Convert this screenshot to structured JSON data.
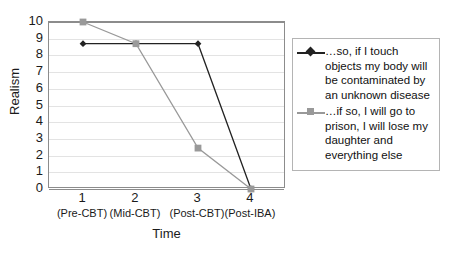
{
  "chart_data": {
    "type": "line",
    "title": "",
    "xlabel": "Time",
    "ylabel": "Realism",
    "ylim": [
      0,
      10
    ],
    "ytick_labels": [
      "10",
      "9",
      "8",
      "7",
      "6",
      "5",
      "4",
      "3",
      "2",
      "1",
      "0"
    ],
    "grid": true,
    "legend_position": "right",
    "x": [
      1,
      2,
      3,
      4
    ],
    "categories": [
      "1",
      "2",
      "3",
      "4"
    ],
    "category_sublabels": [
      "(Pre-CBT)",
      "(Mid-CBT)",
      "(Post-CBT)",
      "(Post-IBA)"
    ],
    "series": [
      {
        "name": "…so, if I touch objects my body will be contaminated by an unknown disease",
        "marker": "diamond",
        "color": "#222222",
        "values": [
          8.7,
          8.7,
          8.7,
          0
        ]
      },
      {
        "name": "…if so, I will go to prison, I will lose my daughter and everything else",
        "marker": "square",
        "color": "#999999",
        "values": [
          10,
          8.7,
          2.45,
          0
        ]
      }
    ]
  },
  "axes": {
    "y_title": "Realism",
    "x_title": "Time",
    "y_ticks": [
      "10",
      "9",
      "8",
      "7",
      "6",
      "5",
      "4",
      "3",
      "2",
      "1",
      "0"
    ],
    "x_ticks": [
      {
        "num": "1",
        "sub": "(Pre-CBT)"
      },
      {
        "num": "2",
        "sub": "(Mid-CBT)"
      },
      {
        "num": "3",
        "sub": "(Post-CBT)"
      },
      {
        "num": "4",
        "sub": "(Post-IBA)"
      }
    ]
  },
  "legend": {
    "entries": [
      {
        "marker": "diamond",
        "color": "#222222",
        "label": "…so, if I touch objects my body will be contaminated by an unknown disease"
      },
      {
        "marker": "square",
        "color": "#999999",
        "label": "…if so, I will go to prison, I will lose my daughter and everything else"
      }
    ]
  },
  "colors": {
    "series_1": "#222222",
    "series_2": "#999999",
    "gridline": "#e3e3e3",
    "axis": "#8c8c8c",
    "legend_border": "#b4b4b4",
    "text": "#1a1a1a",
    "background": "#ffffff"
  }
}
